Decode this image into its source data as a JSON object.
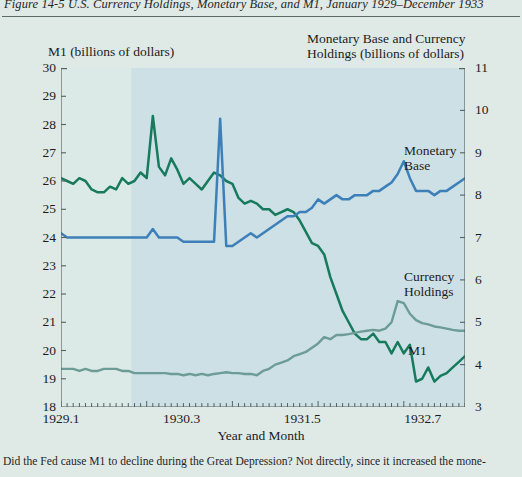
{
  "figure": {
    "number": "Figure 14-5",
    "title": "U.S. Currency Holdings, Monetary Base, and M1, January 1929–December 1933",
    "full_title": "Figure 14-5   U.S. Currency Holdings, Monetary Base, and M1, January 1929–December 1933",
    "caption": "Did the Fed cause M1 to decline during the Great Depression? Not directly, since it increased the mone-"
  },
  "colors": {
    "page_background": "#dfe9e6",
    "plot_background": "#dceae7",
    "shaded_band": "#cde0e6",
    "m1_line": "#177a5c",
    "monetary_base_line": "#3d7fb8",
    "currency_holdings_line": "#6c9c95",
    "axis": "#55625f",
    "rule": "#5c6a68"
  },
  "chart_data": {
    "type": "line",
    "title": "U.S. Currency Holdings, Monetary Base, and M1, January 1929–December 1933",
    "xlabel": "Year and Month",
    "ylabel_left": "M1 (billions of dollars)",
    "ylabel_right": "Monetary Base and Currency Holdings (billions of dollars)",
    "grid": false,
    "legend": "inline-annotations",
    "xlim": [
      1929.1,
      1933.12
    ],
    "xticks": [
      "1929.1",
      "1930.3",
      "1931.5",
      "1932.7",
      "1933.9"
    ],
    "xtick_values": [
      1929.1,
      1930.3,
      1931.5,
      1932.7,
      1933.9
    ],
    "ylim_left": [
      18,
      30
    ],
    "yticks_left": [
      30,
      29,
      28,
      27,
      26,
      25,
      24,
      23,
      22,
      21,
      20,
      19,
      18
    ],
    "ylim_right": [
      3,
      11
    ],
    "yticks_right": [
      11,
      10,
      9,
      8,
      7,
      6,
      5,
      4,
      3
    ],
    "shaded_region": {
      "label": "Great Depression contraction",
      "x_start": 1929.8,
      "x_end": 1933.3
    },
    "series": [
      {
        "name": "M1",
        "axis": "left",
        "color": "#177a5c",
        "units": "billions of dollars",
        "annotation": "M1",
        "values": [
          26.1,
          26.0,
          25.9,
          26.1,
          26.0,
          25.7,
          25.6,
          25.6,
          25.8,
          25.7,
          26.1,
          25.9,
          26.0,
          26.3,
          26.1,
          28.3,
          26.5,
          26.2,
          26.8,
          26.4,
          25.9,
          26.1,
          25.9,
          25.7,
          26.0,
          26.3,
          26.2,
          26.0,
          25.9,
          25.4,
          25.2,
          25.3,
          25.2,
          25.0,
          25.0,
          24.8,
          24.9,
          25.0,
          24.9,
          24.6,
          24.2,
          23.8,
          23.7,
          23.4,
          22.6,
          22.0,
          21.4,
          21.0,
          20.6,
          20.4,
          20.4,
          20.6,
          20.3,
          20.3,
          19.9,
          20.3,
          19.9,
          20.2,
          18.9,
          19.0,
          19.4,
          18.9,
          19.1,
          19.2,
          19.4,
          19.6,
          19.8
        ]
      },
      {
        "name": "Monetary Base",
        "axis": "right",
        "color": "#3d7fb8",
        "units": "billions of dollars",
        "annotation": "Monetary Base",
        "values": [
          7.1,
          7.0,
          7.0,
          7.0,
          7.0,
          7.0,
          7.0,
          7.0,
          7.0,
          7.0,
          7.0,
          7.0,
          7.0,
          7.0,
          7.0,
          7.2,
          7.0,
          7.0,
          7.0,
          7.0,
          6.9,
          6.9,
          6.9,
          6.9,
          6.9,
          6.9,
          9.8,
          6.8,
          6.8,
          6.9,
          7.0,
          7.1,
          7.0,
          7.1,
          7.2,
          7.3,
          7.4,
          7.5,
          7.5,
          7.6,
          7.6,
          7.7,
          7.9,
          7.8,
          7.9,
          8.0,
          7.9,
          7.9,
          8.0,
          8.0,
          8.0,
          8.1,
          8.1,
          8.2,
          8.3,
          8.5,
          8.8,
          8.4,
          8.1,
          8.1,
          8.1,
          8.0,
          8.1,
          8.1,
          8.2,
          8.3,
          8.4
        ]
      },
      {
        "name": "Currency Holdings",
        "axis": "right",
        "color": "#6c9c95",
        "units": "billions of dollars",
        "annotation": "Currency Holdings",
        "values": [
          3.9,
          3.9,
          3.9,
          3.85,
          3.9,
          3.85,
          3.85,
          3.9,
          3.9,
          3.9,
          3.85,
          3.85,
          3.8,
          3.8,
          3.8,
          3.8,
          3.8,
          3.8,
          3.78,
          3.78,
          3.75,
          3.78,
          3.75,
          3.78,
          3.75,
          3.78,
          3.8,
          3.82,
          3.8,
          3.8,
          3.78,
          3.78,
          3.75,
          3.85,
          3.9,
          4.0,
          4.05,
          4.1,
          4.2,
          4.25,
          4.3,
          4.4,
          4.5,
          4.65,
          4.6,
          4.7,
          4.7,
          4.72,
          4.75,
          4.78,
          4.8,
          4.82,
          4.8,
          4.85,
          5.0,
          5.5,
          5.45,
          5.2,
          5.05,
          4.98,
          4.95,
          4.9,
          4.88,
          4.85,
          4.82,
          4.8,
          4.8
        ]
      }
    ]
  },
  "annotations": {
    "monetary_base_line1": "Monetary",
    "monetary_base_line2": "Base",
    "currency_line1": "Currency",
    "currency_line2": "Holdings",
    "m1": "M1"
  }
}
